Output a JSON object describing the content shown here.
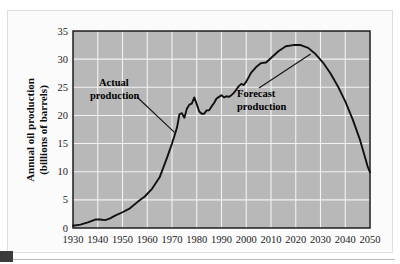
{
  "figure": {
    "background_color": "#ffffff",
    "frame_color": "#dedede",
    "plot_background_color": "#b8b8b8",
    "grid_color": "#f2f2f2",
    "axis_color": "#111111",
    "curve_color": "#111111"
  },
  "chart_data": {
    "type": "line",
    "title": "",
    "xlabel": "",
    "ylabel": "Annual oil production (billions of barrels)",
    "ylabel_lines": [
      "Annual oil production",
      "(billions of barrels)"
    ],
    "xlim": [
      1930,
      2050
    ],
    "ylim": [
      0,
      35
    ],
    "grid": true,
    "legend": "none",
    "xticks": [
      1930,
      1940,
      1950,
      1960,
      1970,
      1980,
      1990,
      2000,
      2010,
      2020,
      2030,
      2040,
      2050
    ],
    "xtick_labels": [
      "1930",
      "1940",
      "1950",
      "1960",
      "1970",
      "1980",
      "1990",
      "2000",
      "2010",
      "2020",
      "2030",
      "2040",
      "2050"
    ],
    "yticks": [
      0,
      5,
      10,
      15,
      20,
      25,
      30,
      35
    ],
    "ytick_labels": [
      "0",
      "5",
      "10",
      "15",
      "20",
      "25",
      "30",
      "35"
    ],
    "series": [
      {
        "name": "Annual oil production",
        "x": [
          1930,
          1933,
          1936,
          1939,
          1941,
          1943,
          1945,
          1947,
          1950,
          1953,
          1956,
          1959,
          1962,
          1965,
          1968,
          1970,
          1971,
          1972,
          1973,
          1974,
          1975,
          1976,
          1977,
          1978,
          1979,
          1980,
          1981,
          1982,
          1983,
          1984,
          1985,
          1986,
          1987,
          1988,
          1989,
          1990,
          1991,
          1992,
          1993,
          1994,
          1995,
          1996,
          1997,
          1998,
          1999,
          2000,
          2002,
          2004,
          2006,
          2008,
          2010,
          2013,
          2016,
          2019,
          2022,
          2025,
          2028,
          2031,
          2034,
          2037,
          2040,
          2043,
          2046,
          2049,
          2050
        ],
        "y": [
          0.4,
          0.6,
          1.0,
          1.5,
          1.5,
          1.4,
          1.7,
          2.2,
          2.8,
          3.5,
          4.6,
          5.6,
          7.0,
          9.0,
          12.5,
          15.0,
          16.4,
          17.8,
          20.2,
          20.4,
          19.6,
          21.2,
          21.9,
          22.1,
          23.2,
          22.0,
          20.7,
          20.3,
          20.3,
          20.9,
          20.9,
          21.6,
          22.2,
          23.0,
          23.3,
          23.6,
          23.2,
          23.4,
          23.3,
          23.6,
          24.0,
          24.6,
          25.2,
          25.6,
          25.4,
          26.0,
          27.6,
          28.6,
          29.3,
          29.4,
          30.2,
          31.4,
          32.3,
          32.5,
          32.5,
          32.0,
          30.9,
          29.4,
          27.5,
          25.2,
          22.5,
          19.3,
          15.6,
          11.0,
          9.9
        ],
        "color": "#111111",
        "style": "solid"
      }
    ],
    "annotations": [
      {
        "id": "actual-production",
        "text_lines": [
          "Actual",
          "production"
        ],
        "text": "Actual production",
        "label_x": 1945,
        "label_y": 25.2,
        "points_to_x": 1971,
        "points_to_y": 17.0
      },
      {
        "id": "forecast-production",
        "text_lines": [
          "Forecast",
          "production"
        ],
        "text": "Forecast production",
        "label_x": 2006,
        "label_y": 22.8,
        "points_to_x": 2026,
        "points_to_y": 30.9
      }
    ]
  }
}
